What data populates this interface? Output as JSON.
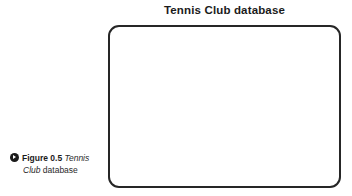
{
  "figure": {
    "title": "Tennis Club database",
    "caption": {
      "marker_icon": "play-circle-icon",
      "label": "Figure 0.5",
      "subject_italic": "Tennis Club",
      "subject_trailing": "database",
      "line1_label": "Figure 0.5",
      "line1_italic": "Tennis",
      "line2_italic": "Club",
      "line2_regular": "database",
      "full_text": "Figure 0.5 Tennis Club database"
    }
  },
  "diagram": {
    "content": "",
    "border_color": "#262626",
    "fill_color": "#ffffff"
  },
  "colors": {
    "page_background": "#ffffff",
    "title_text": "#1b1b1b",
    "caption_text": "#2a2a2a",
    "marker_fill": "#1a1a1a",
    "border": "#262626"
  }
}
